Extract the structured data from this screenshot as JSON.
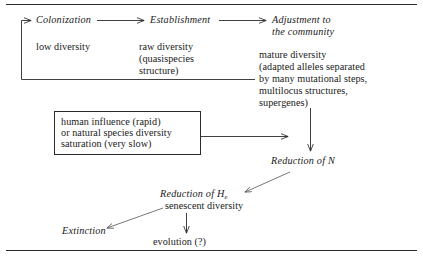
{
  "figure": {
    "type": "flow-diagram",
    "title": "",
    "rules": {
      "top": "horizontal-rule",
      "bottom": "horizontal-rule"
    }
  },
  "nodes": {
    "colonization": {
      "label": "Colonization",
      "style": "italic"
    },
    "low_diversity": {
      "label": "low diversity",
      "style": "roman"
    },
    "establishment": {
      "label": "Establishment",
      "style": "italic"
    },
    "raw_diversity": {
      "line1": "raw diversity",
      "line2": "(quasispecies",
      "line3": "structure)",
      "style": "roman"
    },
    "adjustment": {
      "line1": "Adjustment to",
      "line2": "the community",
      "style": "italic"
    },
    "mature_diversity": {
      "line1": "mature diversity",
      "line2": "(adapted alleles separated",
      "line3": "by many mutational steps,",
      "line4": "multilocus structures,",
      "line5": "supergenes)",
      "style": "roman"
    },
    "influence_box": {
      "line1": "human influence (rapid)",
      "line2": "or natural species diversity",
      "line3": "saturation (very slow)",
      "style": "roman"
    },
    "reduction_of_n": {
      "label": "Reduction of N",
      "style": "italic"
    },
    "reduction_of_he": {
      "prefix": "Reduction of H",
      "subscript": "e",
      "style": "italic"
    },
    "senescent_diversity": {
      "label": "senescent diversity",
      "style": "roman"
    },
    "extinction": {
      "label": "Extinction",
      "style": "italic"
    },
    "evolution": {
      "label": "evolution (?)",
      "style": "roman"
    }
  },
  "connectors": [
    {
      "name": "colonization-to-establishment",
      "kind": "arrow",
      "direction": "right"
    },
    {
      "name": "establishment-to-adjustment",
      "kind": "arrow",
      "direction": "right"
    },
    {
      "name": "feedback-loop-to-colonization",
      "kind": "arrow",
      "direction": "left-up"
    },
    {
      "name": "influence-box-to-reduction-of-n",
      "kind": "arrow",
      "direction": "right"
    },
    {
      "name": "adjustment-to-reduction-of-n",
      "kind": "arrow",
      "direction": "down"
    },
    {
      "name": "reduction-of-n-to-reduction-of-he",
      "kind": "arrow",
      "direction": "down-left"
    },
    {
      "name": "senescent-to-extinction",
      "kind": "arrow",
      "direction": "down-left"
    },
    {
      "name": "senescent-to-evolution",
      "kind": "arrow",
      "direction": "down"
    }
  ],
  "colors": {
    "ink": "#1a1a1a",
    "line": "#2b2b2b",
    "background": "#ffffff"
  }
}
